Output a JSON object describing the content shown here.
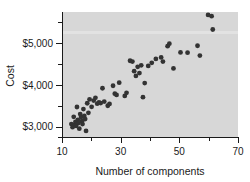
{
  "chart_data": {
    "type": "scatter",
    "title": "",
    "xlabel": "Number of components",
    "ylabel": "Cost",
    "xlim": [
      10,
      70
    ],
    "ylim": [
      2750,
      5750
    ],
    "grid": false,
    "legend": null,
    "x_ticks_major": [
      10,
      30,
      50,
      70
    ],
    "x_tick_labels": [
      "10",
      "30",
      "50",
      "70"
    ],
    "x_ticks_minor": [
      20,
      40,
      60
    ],
    "y_ticks_major": [
      3000,
      4000,
      5000
    ],
    "y_tick_labels": [
      "$3,000",
      "$4,000",
      "$5,000"
    ],
    "y_ticks_minor": [
      2750,
      3500,
      4500,
      5500
    ],
    "panel_color": "#d7d7d7",
    "point_color": "#333333",
    "point_count": 60,
    "points": [
      [
        13.2,
        3060
      ],
      [
        13.6,
        2985
      ],
      [
        14.0,
        3235
      ],
      [
        14.3,
        3045
      ],
      [
        14.6,
        3115
      ],
      [
        14.8,
        3015
      ],
      [
        15.1,
        3470
      ],
      [
        15.4,
        3160
      ],
      [
        15.6,
        3085
      ],
      [
        15.9,
        2950
      ],
      [
        16.2,
        3300
      ],
      [
        16.5,
        3230
      ],
      [
        16.8,
        3130
      ],
      [
        17.0,
        3060
      ],
      [
        17.3,
        3420
      ],
      [
        17.6,
        3255
      ],
      [
        17.9,
        3180
      ],
      [
        18.2,
        2895
      ],
      [
        18.6,
        3560
      ],
      [
        19.0,
        3330
      ],
      [
        19.4,
        3655
      ],
      [
        20.1,
        3475
      ],
      [
        20.8,
        3625
      ],
      [
        21.4,
        3690
      ],
      [
        22.0,
        3550
      ],
      [
        22.6,
        3580
      ],
      [
        23.2,
        3565
      ],
      [
        23.8,
        3920
      ],
      [
        24.4,
        3600
      ],
      [
        25.6,
        3500
      ],
      [
        26.2,
        3545
      ],
      [
        27.4,
        3980
      ],
      [
        28.0,
        3790
      ],
      [
        28.6,
        3760
      ],
      [
        29.5,
        4055
      ],
      [
        31.4,
        3735
      ],
      [
        32.0,
        3810
      ],
      [
        33.2,
        4580
      ],
      [
        34.0,
        4560
      ],
      [
        34.6,
        4330
      ],
      [
        35.2,
        4215
      ],
      [
        35.8,
        4435
      ],
      [
        36.4,
        4285
      ],
      [
        37.0,
        4470
      ],
      [
        37.6,
        3705
      ],
      [
        38.2,
        4045
      ],
      [
        39.4,
        4455
      ],
      [
        40.6,
        4530
      ],
      [
        42.0,
        4625
      ],
      [
        43.8,
        4660
      ],
      [
        44.4,
        4560
      ],
      [
        46.0,
        4930
      ],
      [
        46.6,
        4990
      ],
      [
        48.0,
        4395
      ],
      [
        50.4,
        4780
      ],
      [
        52.8,
        4775
      ],
      [
        56.2,
        4940
      ],
      [
        57.0,
        4705
      ],
      [
        59.8,
        5680
      ],
      [
        61.0,
        5650
      ],
      [
        61.4,
        5330
      ]
    ]
  }
}
